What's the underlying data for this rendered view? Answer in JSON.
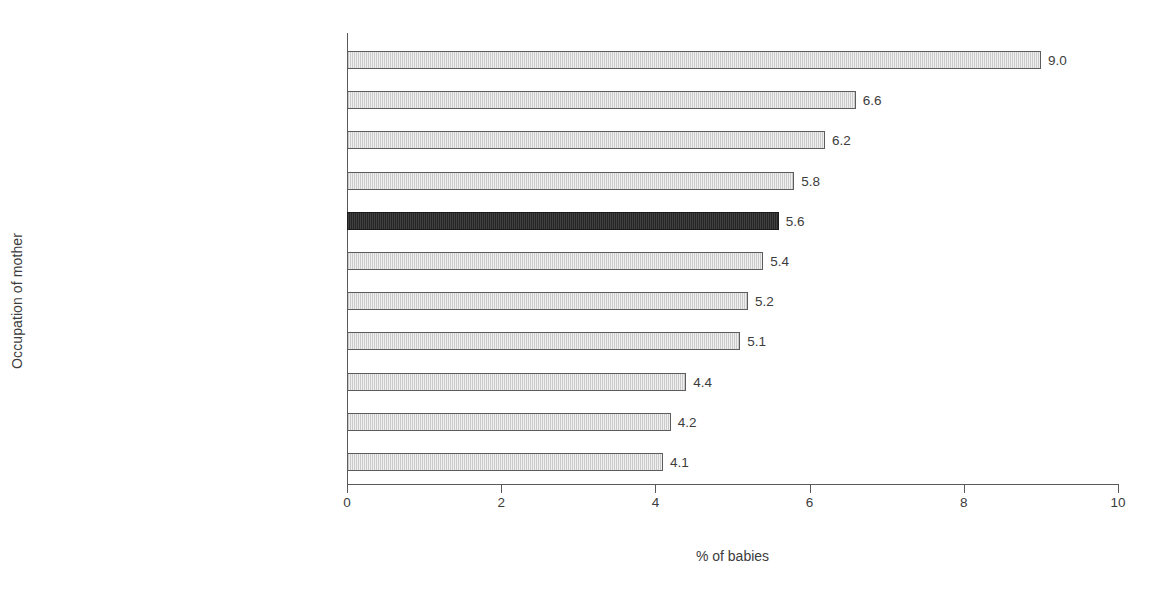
{
  "chart_data": {
    "type": "bar",
    "orientation": "horizontal",
    "title": "",
    "subtitle": "",
    "xlabel": "% of babies",
    "ylabel": "Occupation of mother",
    "xlim": [
      0,
      10
    ],
    "xticks": [
      0,
      2,
      4,
      6,
      8,
      10
    ],
    "xtick_labels": [
      "0",
      "2",
      "4",
      "6",
      "8",
      "10"
    ],
    "grid": false,
    "legend": null,
    "categories": [
      "Unemployed",
      "Semi-skilled Manual Workers",
      "Home Duties",
      "Other Non-manual Workers",
      "State",
      "Employers and Managers",
      "Lower Professional",
      "Intermediate Non-manual Workers",
      "Salaried Employees",
      "Skilled Manual Workers",
      "Higher Professional"
    ],
    "values": [
      9.0,
      6.6,
      6.2,
      5.8,
      5.6,
      5.4,
      5.2,
      5.1,
      4.4,
      4.2,
      4.1
    ],
    "value_labels": [
      "9.0",
      "6.6",
      "6.2",
      "5.8",
      "5.6",
      "5.4",
      "5.2",
      "5.1",
      "4.4",
      "4.2",
      "4.1"
    ],
    "highlighted_category": "State",
    "colors": {
      "bar_fill": "#efefef",
      "bar_border": "#5b5c5e",
      "highlight_fill": "#262626",
      "highlight_border": "#1c1c1c",
      "axis": "#58595b",
      "text": "#3c3c3c",
      "background": "#ffffff"
    }
  }
}
